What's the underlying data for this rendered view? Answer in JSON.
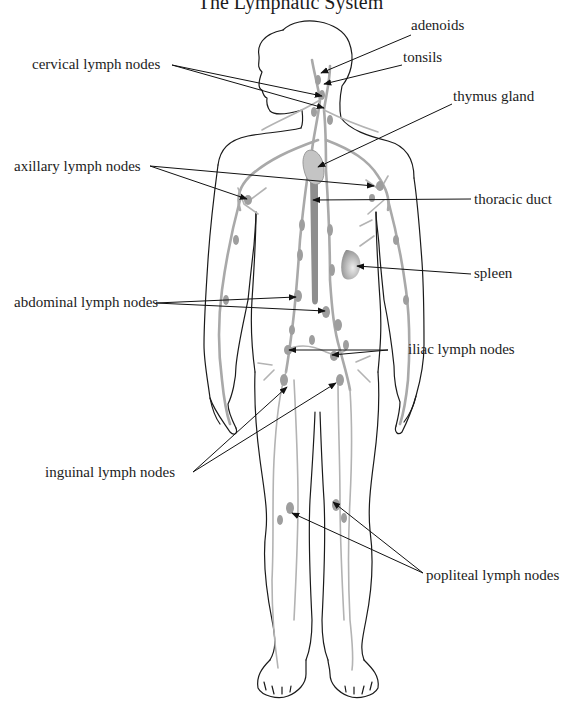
{
  "diagram": {
    "title": "The Lymphatic System",
    "labels": [
      {
        "id": "adenoids",
        "text": "adenoids",
        "x": 411,
        "y": 26
      },
      {
        "id": "tonsils",
        "text": "tonsils",
        "x": 403,
        "y": 57
      },
      {
        "id": "cervical",
        "text": "cervical lymph nodes",
        "x": 32,
        "y": 57
      },
      {
        "id": "thymus",
        "text": "thymus gland",
        "x": 453,
        "y": 96
      },
      {
        "id": "axillary",
        "text": "axillary lymph nodes",
        "x": 14,
        "y": 159
      },
      {
        "id": "thoracic",
        "text": "thoracic duct",
        "x": 474,
        "y": 190
      },
      {
        "id": "spleen",
        "text": "spleen",
        "x": 474,
        "y": 265
      },
      {
        "id": "abdominal",
        "text": "abdominal lymph nodes",
        "x": 14,
        "y": 295
      },
      {
        "id": "iliac",
        "text": "iliac lymph nodes",
        "x": 390,
        "y": 341
      },
      {
        "id": "inguinal",
        "text": "inguinal lymph nodes",
        "x": 45,
        "y": 465
      },
      {
        "id": "popliteal",
        "text": "popliteal lymph nodes",
        "x": 426,
        "y": 568
      }
    ],
    "leaders": [
      {
        "label": "adenoids",
        "from": [
          411,
          35
        ],
        "to": [
          321,
          73
        ]
      },
      {
        "label": "tonsils",
        "from": [
          402,
          65
        ],
        "to": [
          324,
          84
        ]
      },
      {
        "label": "cervical",
        "from": [
          172,
          65
        ],
        "to": [
          322,
          96
        ]
      },
      {
        "label": "cervical",
        "from": [
          172,
          65
        ],
        "to": [
          324,
          108
        ]
      },
      {
        "label": "thymus",
        "from": [
          452,
          104
        ],
        "to": [
          318,
          167
        ]
      },
      {
        "label": "axillary",
        "from": [
          150,
          166
        ],
        "to": [
          247,
          199
        ]
      },
      {
        "label": "axillary",
        "from": [
          150,
          166
        ],
        "to": [
          374,
          186
        ]
      },
      {
        "label": "thoracic",
        "from": [
          471,
          199
        ],
        "to": [
          313,
          200
        ]
      },
      {
        "label": "spleen",
        "from": [
          471,
          274
        ],
        "to": [
          357,
          266
        ]
      },
      {
        "label": "abdominal",
        "from": [
          156,
          303
        ],
        "to": [
          296,
          297
        ]
      },
      {
        "label": "abdominal",
        "from": [
          156,
          303
        ],
        "to": [
          325,
          311
        ]
      },
      {
        "label": "iliac",
        "from": [
          388,
          350
        ],
        "to": [
          289,
          350
        ]
      },
      {
        "label": "iliac",
        "from": [
          388,
          350
        ],
        "to": [
          332,
          355
        ]
      },
      {
        "label": "inguinal",
        "from": [
          193,
          472
        ],
        "to": [
          287,
          387
        ]
      },
      {
        "label": "inguinal",
        "from": [
          193,
          472
        ],
        "to": [
          336,
          383
        ]
      },
      {
        "label": "popliteal",
        "from": [
          423,
          573
        ],
        "to": [
          292,
          513
        ]
      },
      {
        "label": "popliteal",
        "from": [
          423,
          573
        ],
        "to": [
          333,
          502
        ]
      }
    ],
    "colors": {
      "outline": "#1a1a1a",
      "lymph_vessels": "#a9a9a9",
      "nodes": "#9e9e9e",
      "text": "#1c1c1c",
      "background": "#ffffff"
    }
  }
}
